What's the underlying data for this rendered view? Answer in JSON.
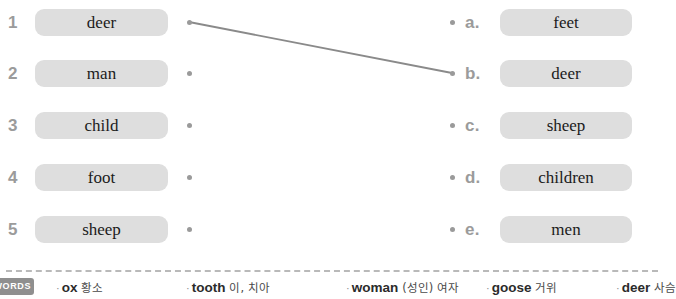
{
  "exercise": {
    "left_column": [
      {
        "marker": "1",
        "word": "deer",
        "dot_y": 22
      },
      {
        "marker": "2",
        "word": "man",
        "dot_y": 73
      },
      {
        "marker": "3",
        "word": "child",
        "dot_y": 125
      },
      {
        "marker": "4",
        "word": "foot",
        "dot_y": 177
      },
      {
        "marker": "5",
        "word": "sheep",
        "dot_y": 229
      }
    ],
    "right_column": [
      {
        "marker": "a.",
        "word": "feet",
        "dot_y": 22
      },
      {
        "marker": "b.",
        "word": "deer",
        "dot_y": 73
      },
      {
        "marker": "c.",
        "word": "sheep",
        "dot_y": 125
      },
      {
        "marker": "d.",
        "word": "children",
        "dot_y": 177
      },
      {
        "marker": "e.",
        "word": "men",
        "dot_y": 229
      }
    ],
    "connections": [
      {
        "from": "1",
        "to": "b.",
        "x1": 189,
        "y1": 22,
        "x2": 452,
        "y2": 73
      }
    ],
    "colors": {
      "word_box": "#dedede",
      "marker_text": "#9b9b9b",
      "word_text": "#1b1b1b",
      "dot": "#9a9a9a",
      "line": "#8a8a8a",
      "badge_bg": "#8f8f8f",
      "divider": "#b9b9b9"
    }
  },
  "footer": {
    "badge_label": "WORDS",
    "glossary": [
      {
        "en": "ox",
        "ko": "황소"
      },
      {
        "en": "tooth",
        "ko": "이, 치아"
      },
      {
        "en": "woman",
        "ko": "(성인) 여자"
      },
      {
        "en": "goose",
        "ko": "거위"
      },
      {
        "en": "deer",
        "ko": "사슴"
      }
    ],
    "glossary_offsets": [
      0,
      130,
      290,
      430,
      560
    ]
  }
}
